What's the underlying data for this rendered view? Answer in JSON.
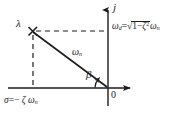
{
  "figure": {
    "background_color": "#ffffff",
    "line_color": "#1c1c1c"
  },
  "axes": {
    "vertical": {
      "name": "imaginary-axis",
      "label": "j",
      "x": 108,
      "y_top": 5,
      "y_bottom": 106,
      "arrow": "up"
    },
    "horizontal": {
      "name": "real-axis",
      "label": "σ = − ζ ω",
      "label_subscript": "n",
      "y": 88,
      "x_left": 8,
      "x_right": 136,
      "arrow": "right"
    },
    "origin_label": "0"
  },
  "pole": {
    "marker": "x-marker",
    "label": "λ",
    "x": 32,
    "y": 31,
    "real_part": "−ζωn",
    "imag_part": "ωd"
  },
  "annotations": {
    "radius_label": "ω",
    "radius_subscript": "n",
    "angle_label": "β",
    "damped_frequency": {
      "lhs": "ω",
      "lhs_subscript": "d",
      "equals": "=",
      "radicand_first": "1",
      "minus": "−",
      "radicand_zeta": "ζ",
      "radicand_exponent": "2",
      "trailing": "ω",
      "trailing_subscript": "n",
      "full_text": "ωd = √(1 − ζ²) ωn"
    },
    "sigma_expression": {
      "sigma": "σ",
      "equals": "=",
      "minus": "−",
      "zeta": "ζ",
      "omega": "ω",
      "omega_subscript": "n",
      "full_text": "σ = − ζ ωn"
    }
  },
  "dashed_lines": [
    {
      "name": "horizontal-projection",
      "from_x": 33,
      "from_y": 31,
      "to_x": 107,
      "to_y": 31
    },
    {
      "name": "vertical-projection",
      "from_x": 33,
      "from_y": 33,
      "to_x": 33,
      "to_y": 88
    }
  ]
}
